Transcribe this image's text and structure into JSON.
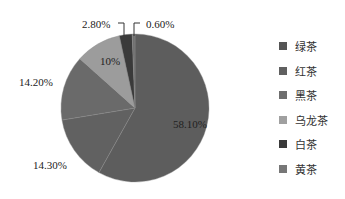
{
  "chart_data": {
    "type": "pie",
    "title": "",
    "categories": [
      "绿茶",
      "红茶",
      "黑茶",
      "乌龙茶",
      "白茶",
      "黄茶"
    ],
    "values": [
      58.1,
      14.3,
      14.2,
      10.0,
      2.8,
      0.6
    ],
    "labels": [
      "58.10%",
      "14.30%",
      "14.20%",
      "10%",
      "2.80%",
      "0.60%"
    ],
    "colors": [
      "#5d5d5d",
      "#616161",
      "#6a6a6a",
      "#9c9c9c",
      "#3a3a3a",
      "#707070"
    ],
    "legend_position": "right",
    "start_angle_deg": 0,
    "direction": "clockwise"
  },
  "legend": {
    "items": [
      {
        "label": "绿茶",
        "color": "#555555"
      },
      {
        "label": "红茶",
        "color": "#606060"
      },
      {
        "label": "黑茶",
        "color": "#6e6e6e"
      },
      {
        "label": "乌龙茶",
        "color": "#a0a0a0"
      },
      {
        "label": "白茶",
        "color": "#3a3a3a"
      },
      {
        "label": "黄茶",
        "color": "#777777"
      }
    ]
  },
  "slice_labels": {
    "green": "58.10%",
    "red": "14.30%",
    "dark": "14.20%",
    "oolong": "10%",
    "white": "2.80%",
    "yellow": "0.60%"
  }
}
